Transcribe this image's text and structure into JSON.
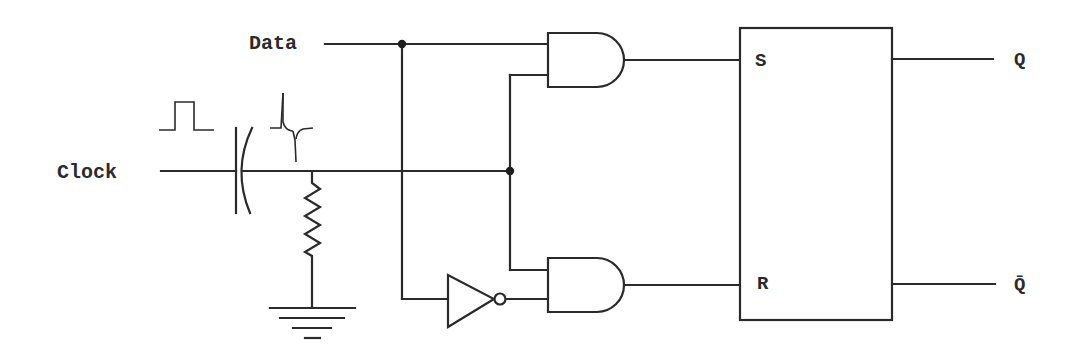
{
  "diagram": {
    "type": "edge-triggered D flip-flop (RC differentiator + AND gates + SR latch)",
    "inputs": {
      "data": "Data",
      "clock": "Clock"
    },
    "latch": {
      "set_pin": "S",
      "reset_pin": "R"
    },
    "outputs": {
      "q": "Q",
      "q_bar": "Q̄"
    },
    "components": [
      {
        "name": "capacitor",
        "role": "differentiator coupling"
      },
      {
        "name": "resistor",
        "role": "differentiator to ground"
      },
      {
        "name": "ground",
        "role": "reference"
      },
      {
        "name": "and-gate-top",
        "inputs": [
          "Data",
          "Clock pulse"
        ],
        "output": "S"
      },
      {
        "name": "not-gate",
        "input": "Data",
        "output": "inverted Data"
      },
      {
        "name": "and-gate-bottom",
        "inputs": [
          "Clock pulse",
          "inverted Data"
        ],
        "output": "R"
      },
      {
        "name": "sr-latch",
        "inputs": [
          "S",
          "R"
        ],
        "outputs": [
          "Q",
          "Q̄"
        ]
      }
    ],
    "waveforms": [
      {
        "name": "square-pulse",
        "description": "clock pulse input"
      },
      {
        "name": "spike-pulse",
        "description": "differentiated pulse (positive and negative spikes)"
      }
    ],
    "colors": {
      "line": "#2a2a2a",
      "background": "#ffffff"
    }
  }
}
